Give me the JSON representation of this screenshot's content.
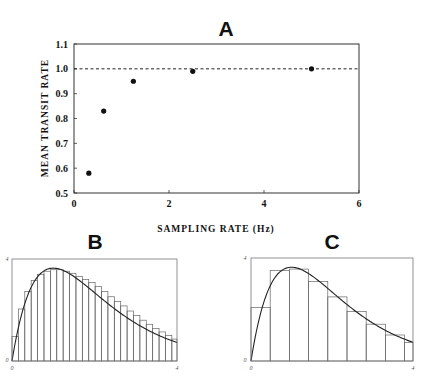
{
  "chart_data": [
    {
      "id": "A",
      "type": "scatter",
      "title": "A",
      "xlabel": "SAMPLING RATE (Hz)",
      "ylabel": "MEAN TRANSIT RATE",
      "xlim": [
        0,
        6
      ],
      "ylim": [
        0.5,
        1.1
      ],
      "xticks": [
        0,
        2,
        4,
        6
      ],
      "xtick_labels": [
        "0",
        "2",
        "4",
        "6"
      ],
      "yticks": [
        0.5,
        0.6,
        0.7,
        0.8,
        0.9,
        1.0,
        1.1
      ],
      "ytick_labels": [
        "0.5",
        "0.6",
        "0.7",
        "0.8",
        "0.9",
        "1.0",
        "1.1"
      ],
      "grid": false,
      "reference_line": {
        "y": 1.0,
        "style": "dashed"
      },
      "points": [
        {
          "x": 0.3125,
          "y": 0.58
        },
        {
          "x": 0.625,
          "y": 0.83
        },
        {
          "x": 1.25,
          "y": 0.95
        },
        {
          "x": 2.5,
          "y": 0.99
        },
        {
          "x": 5.0,
          "y": 1.0
        }
      ]
    },
    {
      "id": "B",
      "type": "bar",
      "title": "B",
      "xlim": [
        0,
        4
      ],
      "ylim": [
        0,
        4
      ],
      "xtick_labels": [
        "0",
        "4"
      ],
      "ytick_labels": [
        "0",
        "4"
      ],
      "description": "Histogram (fine bins) with overlaid smooth transit-time curve",
      "bin_width": 0.155,
      "bar_heights": [
        0.96,
        2.04,
        2.72,
        3.16,
        3.4,
        3.52,
        3.58,
        3.58,
        3.52,
        3.44,
        3.32,
        3.2,
        3.08,
        2.92,
        2.72,
        2.52,
        2.34,
        2.16,
        1.96,
        1.78,
        1.6,
        1.44,
        1.28,
        1.14,
        1.0,
        0.86
      ],
      "curve": {
        "formula": "9.9 * x * exp(-x)",
        "x_range": [
          0,
          4
        ]
      }
    },
    {
      "id": "C",
      "type": "bar",
      "title": "C",
      "xlim": [
        0,
        4
      ],
      "ylim": [
        0,
        4
      ],
      "xtick_labels": [
        "0",
        "4"
      ],
      "ytick_labels": [
        "0",
        "4"
      ],
      "description": "Histogram (coarse bins) with overlaid smooth transit-time curve",
      "bin_width": 0.474,
      "bar_heights": [
        2.08,
        3.52,
        3.57,
        3.09,
        2.49,
        1.92,
        1.43,
        1.01,
        0.72
      ],
      "curve": {
        "formula": "9.9 * x * exp(-x)",
        "x_range": [
          0,
          4
        ]
      }
    }
  ]
}
